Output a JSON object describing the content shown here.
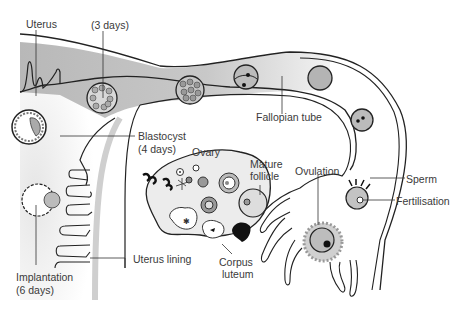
{
  "labels": {
    "uterus": "Uterus",
    "three_days": "(3 days)",
    "fallopian_tube": "Fallopian tube",
    "blastocyst": "Blastocyst",
    "blastocyst_days": "(4 days)",
    "ovary": "Ovary",
    "mature_follicle_1": "Mature",
    "mature_follicle_2": "follicle",
    "ovulation": "Ovulation",
    "sperm": "Sperm",
    "fertilisation": "Fertilisation",
    "uterus_lining": "Uterus lining",
    "corpus_luteum_1": "Corpus",
    "corpus_luteum_2": "luteum",
    "implantation": "Implantation",
    "implantation_days": "(6 days)"
  },
  "colors": {
    "outline": "#222222",
    "tube_fill": "#c8c8c8",
    "cell_fill": "#aaaaaa",
    "ovary_fill": "#ececec",
    "label_text": "#3a3a3a"
  }
}
